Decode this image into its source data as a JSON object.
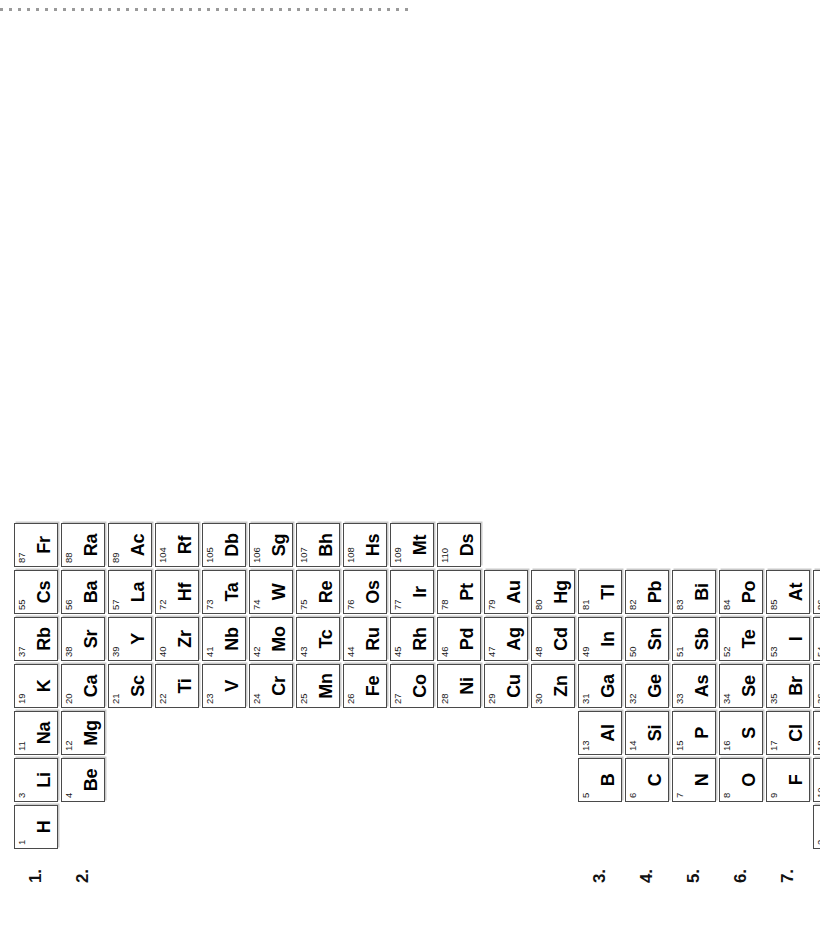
{
  "page": {
    "orientation": "rotated-90-ccw",
    "background_color": "#ffffff",
    "cell_border_color": "#4a4a4a",
    "cell_shadow_color": "#c9c9c9",
    "top_rule_color": "#9a9a9a"
  },
  "group_labels": [
    {
      "id": "group-1",
      "text": "1.",
      "group": 1
    },
    {
      "id": "group-2",
      "text": "2.",
      "group": 2
    },
    {
      "id": "group-3",
      "text": "3.",
      "group": 3
    },
    {
      "id": "group-4",
      "text": "4.",
      "group": 4
    },
    {
      "id": "group-5",
      "text": "5.",
      "group": 5
    },
    {
      "id": "group-6",
      "text": "6.",
      "group": 6
    },
    {
      "id": "group-7",
      "text": "7.",
      "group": 7
    },
    {
      "id": "group-0",
      "text": "0.",
      "group": 0
    }
  ],
  "elements": [
    {
      "number": "1",
      "symbol": "H",
      "col": 1,
      "row": 1
    },
    {
      "number": "2",
      "symbol": "He",
      "col": 18,
      "row": 1
    },
    {
      "number": "3",
      "symbol": "Li",
      "col": 1,
      "row": 2
    },
    {
      "number": "4",
      "symbol": "Be",
      "col": 2,
      "row": 2
    },
    {
      "number": "5",
      "symbol": "B",
      "col": 13,
      "row": 2
    },
    {
      "number": "6",
      "symbol": "C",
      "col": 14,
      "row": 2
    },
    {
      "number": "7",
      "symbol": "N",
      "col": 15,
      "row": 2
    },
    {
      "number": "8",
      "symbol": "O",
      "col": 16,
      "row": 2
    },
    {
      "number": "9",
      "symbol": "F",
      "col": 17,
      "row": 2
    },
    {
      "number": "10",
      "symbol": "Ne",
      "col": 18,
      "row": 2
    },
    {
      "number": "11",
      "symbol": "Na",
      "col": 1,
      "row": 3
    },
    {
      "number": "12",
      "symbol": "Mg",
      "col": 2,
      "row": 3
    },
    {
      "number": "13",
      "symbol": "Al",
      "col": 13,
      "row": 3
    },
    {
      "number": "14",
      "symbol": "Si",
      "col": 14,
      "row": 3
    },
    {
      "number": "15",
      "symbol": "P",
      "col": 15,
      "row": 3
    },
    {
      "number": "16",
      "symbol": "S",
      "col": 16,
      "row": 3
    },
    {
      "number": "17",
      "symbol": "Cl",
      "col": 17,
      "row": 3
    },
    {
      "number": "18",
      "symbol": "Ar",
      "col": 18,
      "row": 3
    },
    {
      "number": "19",
      "symbol": "K",
      "col": 1,
      "row": 4
    },
    {
      "number": "20",
      "symbol": "Ca",
      "col": 2,
      "row": 4
    },
    {
      "number": "21",
      "symbol": "Sc",
      "col": 3,
      "row": 4
    },
    {
      "number": "22",
      "symbol": "Ti",
      "col": 4,
      "row": 4
    },
    {
      "number": "23",
      "symbol": "V",
      "col": 5,
      "row": 4
    },
    {
      "number": "24",
      "symbol": "Cr",
      "col": 6,
      "row": 4
    },
    {
      "number": "25",
      "symbol": "Mn",
      "col": 7,
      "row": 4
    },
    {
      "number": "26",
      "symbol": "Fe",
      "col": 8,
      "row": 4
    },
    {
      "number": "27",
      "symbol": "Co",
      "col": 9,
      "row": 4
    },
    {
      "number": "28",
      "symbol": "Ni",
      "col": 10,
      "row": 4
    },
    {
      "number": "29",
      "symbol": "Cu",
      "col": 11,
      "row": 4
    },
    {
      "number": "30",
      "symbol": "Zn",
      "col": 12,
      "row": 4
    },
    {
      "number": "31",
      "symbol": "Ga",
      "col": 13,
      "row": 4
    },
    {
      "number": "32",
      "symbol": "Ge",
      "col": 14,
      "row": 4
    },
    {
      "number": "33",
      "symbol": "As",
      "col": 15,
      "row": 4
    },
    {
      "number": "34",
      "symbol": "Se",
      "col": 16,
      "row": 4
    },
    {
      "number": "35",
      "symbol": "Br",
      "col": 17,
      "row": 4
    },
    {
      "number": "36",
      "symbol": "Kr",
      "col": 18,
      "row": 4
    },
    {
      "number": "37",
      "symbol": "Rb",
      "col": 1,
      "row": 5
    },
    {
      "number": "38",
      "symbol": "Sr",
      "col": 2,
      "row": 5
    },
    {
      "number": "39",
      "symbol": "Y",
      "col": 3,
      "row": 5
    },
    {
      "number": "40",
      "symbol": "Zr",
      "col": 4,
      "row": 5
    },
    {
      "number": "41",
      "symbol": "Nb",
      "col": 5,
      "row": 5
    },
    {
      "number": "42",
      "symbol": "Mo",
      "col": 6,
      "row": 5
    },
    {
      "number": "43",
      "symbol": "Tc",
      "col": 7,
      "row": 5
    },
    {
      "number": "44",
      "symbol": "Ru",
      "col": 8,
      "row": 5
    },
    {
      "number": "45",
      "symbol": "Rh",
      "col": 9,
      "row": 5
    },
    {
      "number": "46",
      "symbol": "Pd",
      "col": 10,
      "row": 5
    },
    {
      "number": "47",
      "symbol": "Ag",
      "col": 11,
      "row": 5
    },
    {
      "number": "48",
      "symbol": "Cd",
      "col": 12,
      "row": 5
    },
    {
      "number": "49",
      "symbol": "In",
      "col": 13,
      "row": 5
    },
    {
      "number": "50",
      "symbol": "Sn",
      "col": 14,
      "row": 5
    },
    {
      "number": "51",
      "symbol": "Sb",
      "col": 15,
      "row": 5
    },
    {
      "number": "52",
      "symbol": "Te",
      "col": 16,
      "row": 5
    },
    {
      "number": "53",
      "symbol": "I",
      "col": 17,
      "row": 5
    },
    {
      "number": "54",
      "symbol": "Xe",
      "col": 18,
      "row": 5
    },
    {
      "number": "55",
      "symbol": "Cs",
      "col": 1,
      "row": 6
    },
    {
      "number": "56",
      "symbol": "Ba",
      "col": 2,
      "row": 6
    },
    {
      "number": "57",
      "symbol": "La",
      "col": 3,
      "row": 6
    },
    {
      "number": "72",
      "symbol": "Hf",
      "col": 4,
      "row": 6
    },
    {
      "number": "73",
      "symbol": "Ta",
      "col": 5,
      "row": 6
    },
    {
      "number": "74",
      "symbol": "W",
      "col": 6,
      "row": 6
    },
    {
      "number": "75",
      "symbol": "Re",
      "col": 7,
      "row": 6
    },
    {
      "number": "76",
      "symbol": "Os",
      "col": 8,
      "row": 6
    },
    {
      "number": "77",
      "symbol": "Ir",
      "col": 9,
      "row": 6
    },
    {
      "number": "78",
      "symbol": "Pt",
      "col": 10,
      "row": 6
    },
    {
      "number": "79",
      "symbol": "Au",
      "col": 11,
      "row": 6
    },
    {
      "number": "80",
      "symbol": "Hg",
      "col": 12,
      "row": 6
    },
    {
      "number": "81",
      "symbol": "Tl",
      "col": 13,
      "row": 6
    },
    {
      "number": "82",
      "symbol": "Pb",
      "col": 14,
      "row": 6
    },
    {
      "number": "83",
      "symbol": "Bi",
      "col": 15,
      "row": 6
    },
    {
      "number": "84",
      "symbol": "Po",
      "col": 16,
      "row": 6
    },
    {
      "number": "85",
      "symbol": "At",
      "col": 17,
      "row": 6
    },
    {
      "number": "86",
      "symbol": "Rn",
      "col": 18,
      "row": 6
    },
    {
      "number": "87",
      "symbol": "Fr",
      "col": 1,
      "row": 7
    },
    {
      "number": "88",
      "symbol": "Ra",
      "col": 2,
      "row": 7
    },
    {
      "number": "89",
      "symbol": "Ac",
      "col": 3,
      "row": 7
    },
    {
      "number": "104",
      "symbol": "Rf",
      "col": 4,
      "row": 7
    },
    {
      "number": "105",
      "symbol": "Db",
      "col": 5,
      "row": 7
    },
    {
      "number": "106",
      "symbol": "Sg",
      "col": 6,
      "row": 7
    },
    {
      "number": "107",
      "symbol": "Bh",
      "col": 7,
      "row": 7
    },
    {
      "number": "108",
      "symbol": "Hs",
      "col": 8,
      "row": 7
    },
    {
      "number": "109",
      "symbol": "Mt",
      "col": 9,
      "row": 7
    },
    {
      "number": "110",
      "symbol": "Ds",
      "col": 10,
      "row": 7
    }
  ]
}
